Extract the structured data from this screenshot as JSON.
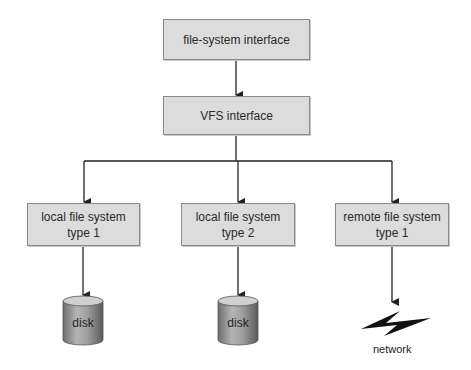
{
  "boxes": {
    "fs_interface": {
      "label": "file-system interface"
    },
    "vfs_interface": {
      "label": "VFS interface"
    },
    "local1": {
      "line1": "local file system",
      "line2": "type 1"
    },
    "local2": {
      "line1": "local file system",
      "line2": "type 2"
    },
    "remote1": {
      "line1": "remote file system",
      "line2": "type 1"
    }
  },
  "endpoints": {
    "disk1": {
      "label": "disk",
      "icon": "disk-cylinder-icon"
    },
    "disk2": {
      "label": "disk",
      "icon": "disk-cylinder-icon"
    },
    "network": {
      "label": "network",
      "icon": "lightning-bolt-icon"
    }
  },
  "colors": {
    "box_fill": "#dcdcdc",
    "box_border": "#8a8a8a",
    "line": "#222222"
  }
}
